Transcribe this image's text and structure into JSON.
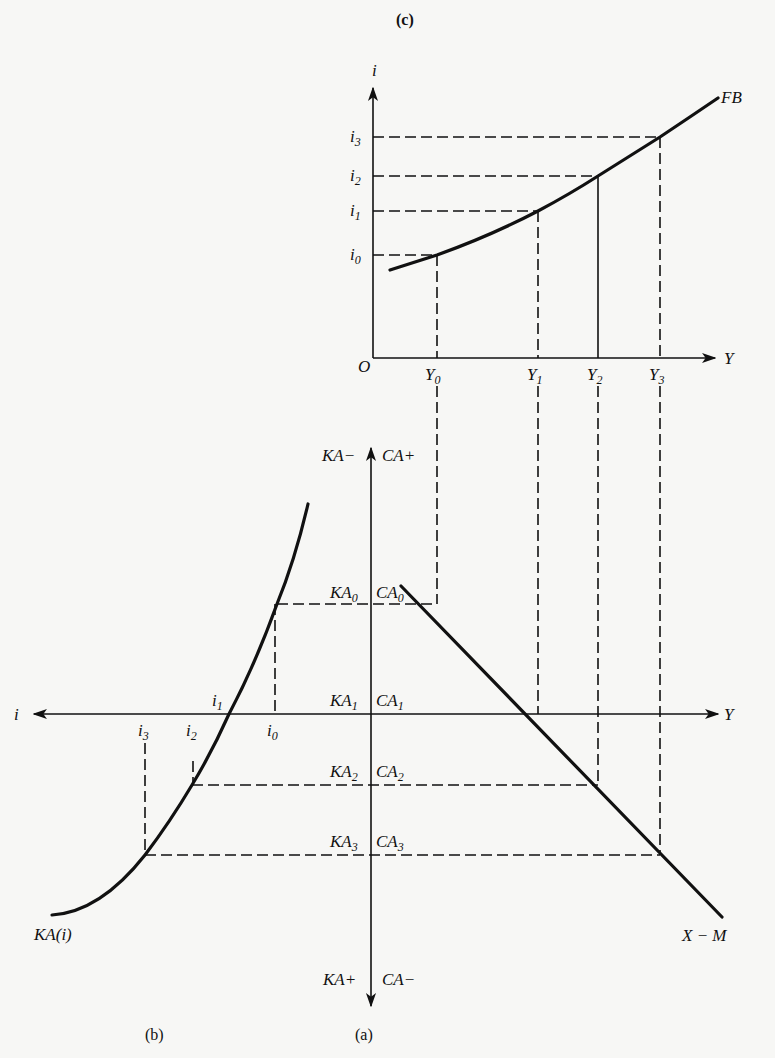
{
  "figure": {
    "panels": {
      "c": "(c)",
      "b": "(b)",
      "a": "(a)"
    },
    "top_panel": {
      "y_axis_label": "i",
      "x_axis_label": "Y",
      "origin_label": "O",
      "curve_label": "FB",
      "i_levels": [
        {
          "base": "i",
          "sub": "0"
        },
        {
          "base": "i",
          "sub": "1"
        },
        {
          "base": "i",
          "sub": "2"
        },
        {
          "base": "i",
          "sub": "3"
        }
      ],
      "y_levels": [
        {
          "base": "Y",
          "sub": "0"
        },
        {
          "base": "Y",
          "sub": "1"
        },
        {
          "base": "Y",
          "sub": "2"
        },
        {
          "base": "Y",
          "sub": "3"
        }
      ]
    },
    "bottom_panel": {
      "axis_top_left": "KA−",
      "axis_top_right": "CA+",
      "axis_bottom_left": "KA+",
      "axis_bottom_right": "CA−",
      "left_axis_label": "i",
      "right_axis_label": "Y",
      "ka_curve_label": "KA(i)",
      "xm_line_label": "X − M",
      "ka_levels": [
        {
          "base": "KA",
          "sub": "0"
        },
        {
          "base": "KA",
          "sub": "1"
        },
        {
          "base": "KA",
          "sub": "2"
        },
        {
          "base": "KA",
          "sub": "3"
        }
      ],
      "ca_levels": [
        {
          "base": "CA",
          "sub": "0"
        },
        {
          "base": "CA",
          "sub": "1"
        },
        {
          "base": "CA",
          "sub": "2"
        },
        {
          "base": "CA",
          "sub": "3"
        }
      ],
      "i_ticks": [
        {
          "base": "i",
          "sub": "0"
        },
        {
          "base": "i",
          "sub": "1"
        },
        {
          "base": "i",
          "sub": "2"
        },
        {
          "base": "i",
          "sub": "3"
        }
      ]
    }
  }
}
